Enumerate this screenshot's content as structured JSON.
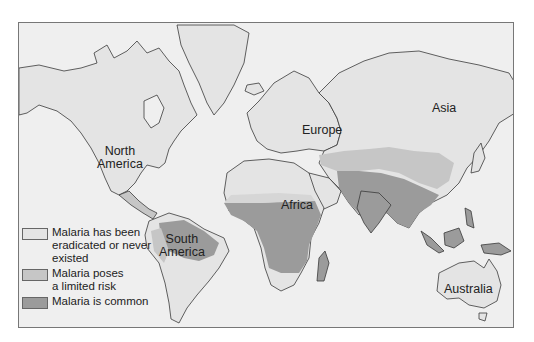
{
  "map": {
    "title": "",
    "colors": {
      "ocean": "#efefef",
      "eradicated": "#e4e4e4",
      "limited": "#c6c6c6",
      "common": "#9b9b9b",
      "outline": "#3a3a3a"
    },
    "labels": {
      "north_america_1": "North",
      "north_america_2": "America",
      "south_america_1": "South",
      "south_america_2": "America",
      "europe": "Europe",
      "asia": "Asia",
      "africa": "Africa",
      "australia": "Australia"
    }
  },
  "legend": {
    "items": [
      {
        "label": "Malaria has been eradicated or never existed",
        "color": "#e4e4e4"
      },
      {
        "label": "Malaria poses a limited risk",
        "color": "#c6c6c6"
      },
      {
        "label": "Malaria is common",
        "color": "#9b9b9b"
      }
    ]
  }
}
